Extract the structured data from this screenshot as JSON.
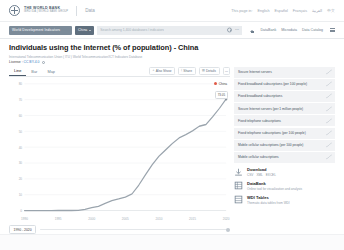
{
  "topbar": {
    "brand_main": "THE WORLD BANK",
    "brand_sub": "IBRD  IDA  |  WORLD BANK GROUP",
    "product": "Data",
    "lang_lead": "This page in:",
    "languages": [
      "English",
      "Español",
      "Français",
      "العربية",
      "中文"
    ]
  },
  "navbar": {
    "database_pill": "World Development Indicators",
    "country_pill": "China",
    "search_placeholder": "Search among 1,400 databases / indicators",
    "gear_icon": "gear-icon",
    "more_icon": "ellipsis-icon",
    "home_label": "DataBank",
    "links": [
      "Microdata",
      "Data Catalog"
    ],
    "menu_icon": "hamburger-icon"
  },
  "page": {
    "title": "Individuals using the Internet (% of population) - China",
    "source": "International Telecommunication Union ( ITU ) World Telecommunication/ICT Indicators Database",
    "license_label": "License :",
    "license_value": "CC BY-4.0"
  },
  "chart_toolbar": {
    "tabs": [
      {
        "label": "Line",
        "active": true
      },
      {
        "label": "Bar",
        "active": false
      },
      {
        "label": "Map",
        "active": false
      }
    ],
    "buttons": [
      {
        "label": "Also Show",
        "glyph": "+",
        "name": "also-show-button"
      },
      {
        "label": "Share",
        "glyph": "⟨",
        "name": "share-button"
      },
      {
        "label": "Details",
        "glyph": "▤",
        "name": "details-button"
      }
    ],
    "more_button": "⋯"
  },
  "chart_legend": {
    "series_label": "China",
    "tooltip": "73.05"
  },
  "range": {
    "value": "1990 - 2020"
  },
  "chart_data": {
    "type": "line",
    "title": "Individuals using the Internet (% of population) - China",
    "xlabel": "",
    "ylabel": "",
    "xlim": [
      1990,
      2020
    ],
    "ylim": [
      0,
      80
    ],
    "grid": true,
    "legend_position": "top-right",
    "xticks": [
      1990,
      1995,
      2000,
      2005,
      2010,
      2015,
      2020
    ],
    "yticks": [
      0,
      10,
      20,
      30,
      40,
      50,
      60,
      70,
      80
    ],
    "series": [
      {
        "name": "China",
        "color": "#9aa4ad",
        "x": [
          1990,
          1991,
          1992,
          1993,
          1994,
          1995,
          1996,
          1997,
          1998,
          1999,
          2000,
          2001,
          2002,
          2003,
          2004,
          2005,
          2006,
          2007,
          2008,
          2009,
          2010,
          2011,
          2012,
          2013,
          2014,
          2015,
          2016,
          2017,
          2018,
          2019,
          2020
        ],
        "values": [
          0.0,
          0.0,
          0.0,
          0.0,
          0.0,
          0.01,
          0.03,
          0.03,
          0.16,
          0.71,
          1.78,
          2.64,
          4.6,
          6.2,
          7.3,
          8.52,
          10.52,
          16.0,
          22.6,
          28.9,
          34.3,
          38.3,
          42.3,
          45.8,
          47.9,
          50.3,
          53.2,
          54.3,
          59.2,
          64.5,
          70.4
        ]
      }
    ]
  },
  "related": {
    "items": [
      {
        "label": "Secure Internet servers"
      },
      {
        "label": "Fixed broadband subscriptions (per 100 people)"
      },
      {
        "label": "Fixed broadband subscriptions"
      },
      {
        "label": "Secure Internet servers (per 1 million people)"
      },
      {
        "label": "Fixed telephone subscriptions"
      },
      {
        "label": "Fixed telephone subscriptions (per 100 people)"
      },
      {
        "label": "Mobile cellular subscriptions (per 100 people)"
      },
      {
        "label": "Mobile cellular subscriptions"
      }
    ]
  },
  "resources": [
    {
      "icon": "download-icon",
      "title": "Download",
      "links": [
        "CSV",
        "XML",
        "EXCEL"
      ],
      "subtitle": ""
    },
    {
      "icon": "databank-icon",
      "title": "DataBank",
      "links": [],
      "subtitle": "Online tool for visualization and analysis"
    },
    {
      "icon": "table-icon",
      "title": "WDI Tables",
      "links": [],
      "subtitle": "Thematic data tables from WDI"
    }
  ]
}
